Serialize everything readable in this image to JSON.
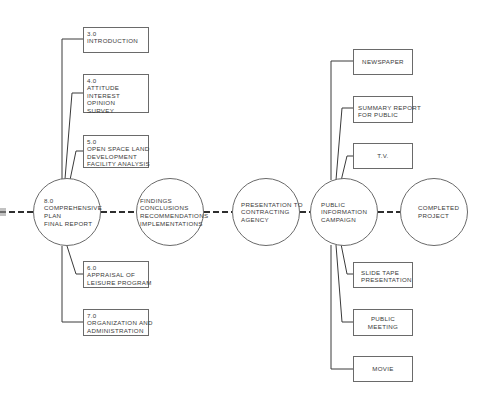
{
  "diagram": {
    "left_boxes": [
      {
        "id": "3.0",
        "lines": [
          "3.0",
          "INTRODUCTION"
        ]
      },
      {
        "id": "4.0",
        "lines": [
          "4.0",
          "ATTITUDE",
          "INTEREST",
          "OPINION",
          "SURVEY"
        ]
      },
      {
        "id": "5.0",
        "lines": [
          "5.0",
          "OPEN SPACE LAND",
          "DEVELOPMENT",
          "FACILITY ANALYSIS"
        ]
      },
      {
        "id": "6.0",
        "lines": [
          "6.0",
          "APPRAISAL OF",
          "LEISURE PROGRAM"
        ]
      },
      {
        "id": "7.0",
        "lines": [
          "7.0",
          "ORGANIZATION AND",
          "ADMINISTRATION"
        ]
      }
    ],
    "circles": [
      {
        "id": "comprehensive-plan",
        "lines": [
          "8.0",
          "COMPREHENSIVE",
          "PLAN",
          "FINAL REPORT"
        ]
      },
      {
        "id": "findings",
        "lines": [
          "FINDINGS",
          "CONCLUSIONS",
          "RECOMMENDATIONS",
          "IMPLEMENTATIONS"
        ]
      },
      {
        "id": "presentation",
        "lines": [
          "PRESENTATION TO",
          "CONTRACTING",
          "AGENCY"
        ]
      },
      {
        "id": "public-information",
        "lines": [
          "PUBLIC",
          "INFORMATION",
          "CAMPAIGN"
        ]
      },
      {
        "id": "completed",
        "lines": [
          "COMPLETED",
          "PROJECT"
        ]
      }
    ],
    "right_boxes": [
      {
        "id": "newspaper",
        "lines": [
          "NEWSPAPER"
        ]
      },
      {
        "id": "summary-report",
        "lines": [
          "SUMMARY REPORT",
          "FOR PUBLIC"
        ]
      },
      {
        "id": "tv",
        "lines": [
          "T.V."
        ]
      },
      {
        "id": "slide-tape",
        "lines": [
          "SLIDE TAPE",
          "PRESENTATION"
        ]
      },
      {
        "id": "public-meeting",
        "lines": [
          "PUBLIC",
          "MEETING"
        ]
      },
      {
        "id": "movie",
        "lines": [
          "MOVIE"
        ]
      }
    ],
    "colors": {
      "line": "#3a3a3a",
      "border": "#6a6a6a",
      "text": "#3a3a3a",
      "background": "#ffffff"
    }
  }
}
